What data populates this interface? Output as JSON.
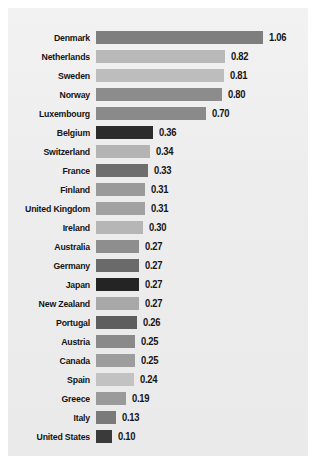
{
  "chart_data": {
    "type": "bar",
    "orientation": "horizontal",
    "title": "",
    "subtitle": "",
    "xlabel": "",
    "ylabel": "",
    "xlim": [
      0,
      1.06
    ],
    "grid": false,
    "legend": null,
    "value_label_format": "0.00",
    "categories": [
      "Denmark",
      "Netherlands",
      "Sweden",
      "Norway",
      "Luxembourg",
      "Belgium",
      "Switzerland",
      "France",
      "Finland",
      "United Kingdom",
      "Ireland",
      "Australia",
      "Germany",
      "Japan",
      "New Zealand",
      "Portugal",
      "Austria",
      "Canada",
      "Spain",
      "Greece",
      "Italy",
      "United States"
    ],
    "values": [
      1.06,
      0.82,
      0.81,
      0.8,
      0.7,
      0.36,
      0.34,
      0.33,
      0.31,
      0.31,
      0.3,
      0.27,
      0.27,
      0.27,
      0.27,
      0.26,
      0.25,
      0.25,
      0.24,
      0.19,
      0.13,
      0.1
    ],
    "value_labels": [
      "1.06",
      "0.82",
      "0.81",
      "0.80",
      "0.70",
      "0.36",
      "0.34",
      "0.33",
      "0.31",
      "0.31",
      "0.30",
      "0.27",
      "0.27",
      "0.27",
      "0.27",
      "0.26",
      "0.25",
      "0.25",
      "0.24",
      "0.19",
      "0.13",
      "0.10"
    ],
    "bar_colors": [
      "#7e7e7e",
      "#b9b9b9",
      "#bdbdbd",
      "#8c8c8c",
      "#8a8a8a",
      "#2b2b2b",
      "#b4b4b4",
      "#6e6e6e",
      "#9a9a9a",
      "#a2a2a2",
      "#b6b6b6",
      "#8e8e8e",
      "#6a6a6a",
      "#242424",
      "#a8a8a8",
      "#5e5e5e",
      "#8a8a8a",
      "#9d9d9d",
      "#c2c2c2",
      "#9a9a9a",
      "#7a7a7a",
      "#3a3a3a"
    ]
  },
  "figure": {
    "background_color": "#ffffff",
    "panel_color": "#eeeeee",
    "text_color": "#141414"
  }
}
